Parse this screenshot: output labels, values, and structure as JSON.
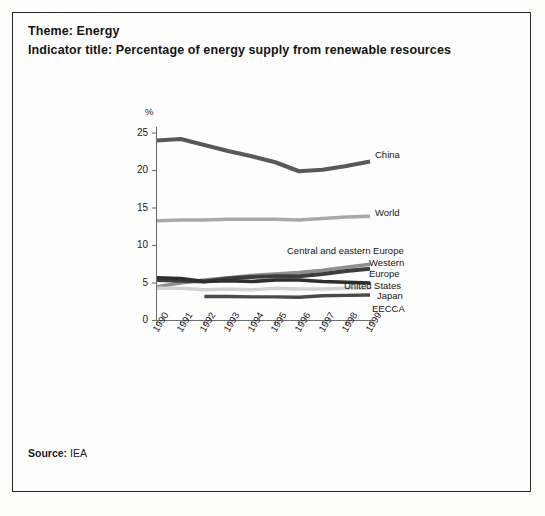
{
  "header": {
    "theme_line": "Theme: Energy",
    "indicator_line": "Indicator title: Percentage of energy supply from renewable resources"
  },
  "footer": {
    "source_label": "Source:",
    "source_value": " IEA"
  },
  "chart_data": {
    "type": "line",
    "title": "Percentage of energy supply from renewable resources",
    "xlabel": "",
    "ylabel": "%",
    "ylim": [
      0,
      25
    ],
    "yticks": [
      0,
      5,
      10,
      15,
      20,
      25
    ],
    "ytick_labels": [
      "0",
      "5",
      "10",
      "15",
      "20",
      "25"
    ],
    "grid": false,
    "legend_position": "right-inline",
    "categories": [
      1990,
      1991,
      1992,
      1993,
      1994,
      1995,
      1996,
      1997,
      1998,
      1999
    ],
    "xtick_labels": [
      "1990",
      "1991",
      "1992",
      "1993",
      "1994",
      "1995",
      "1996",
      "1997",
      "1998",
      "1999"
    ],
    "series": [
      {
        "name": "China",
        "label": "China",
        "color": "#595959",
        "width": 4.2,
        "values": [
          24.0,
          24.2,
          23.4,
          22.6,
          21.9,
          21.1,
          19.9,
          20.1,
          20.6,
          21.2
        ]
      },
      {
        "name": "World",
        "label": "World",
        "color": "#a8a8a8",
        "width": 3.6,
        "values": [
          13.3,
          13.4,
          13.4,
          13.5,
          13.5,
          13.5,
          13.4,
          13.6,
          13.8,
          13.9
        ]
      },
      {
        "name": "Central and eastern Europe",
        "label": "Central and eastern Europe",
        "color": "#8e8e8e",
        "width": 3.6,
        "values": [
          4.5,
          5.0,
          5.4,
          5.7,
          6.0,
          6.2,
          6.4,
          6.7,
          7.1,
          7.5
        ]
      },
      {
        "name": "Western Europe",
        "label": "Western\nEurope",
        "color": "#3d3d3d",
        "width": 3.8,
        "values": [
          5.4,
          5.3,
          5.2,
          5.6,
          5.8,
          5.9,
          5.9,
          6.2,
          6.6,
          6.9
        ]
      },
      {
        "name": "United States",
        "label": "United States",
        "color": "#2e2e2e",
        "width": 3.6,
        "values": [
          5.7,
          5.6,
          5.2,
          5.3,
          5.2,
          5.4,
          5.4,
          5.2,
          5.1,
          5.0
        ]
      },
      {
        "name": "Japan",
        "label": "Japan",
        "color": "#d2d2d2",
        "width": 3.4,
        "values": [
          4.3,
          4.3,
          4.1,
          4.2,
          4.1,
          4.3,
          4.2,
          4.2,
          4.3,
          4.3
        ]
      },
      {
        "name": "EECCA",
        "label": "EECCA",
        "color": "#4a4a4a",
        "width": 3.4,
        "start_index": 2,
        "values": [
          null,
          null,
          3.2,
          3.2,
          3.15,
          3.15,
          3.1,
          3.3,
          3.35,
          3.4
        ]
      }
    ]
  }
}
